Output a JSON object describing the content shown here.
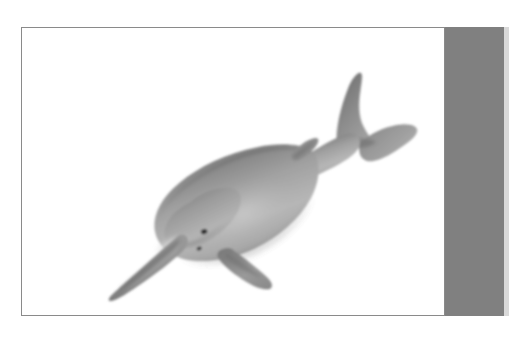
{
  "page": {
    "background_color": "#ffffff",
    "width": 514,
    "height": 339
  },
  "figure": {
    "alt_text": "Grayscale illustration of a river dolphin with a long narrow beak, swimming diagonally upward to the right",
    "border_color": "#8a8a8a",
    "card_background": "#ffffff",
    "body_color_light": "#b0b0b0",
    "body_color_mid": "#949494",
    "body_color_dark": "#6f6f6f",
    "belly_color": "#e2e2e2",
    "eye_color": "#2b2b2b",
    "parts": [
      {
        "name": "rostrum",
        "label": "Rostrum (beak)"
      },
      {
        "name": "melon",
        "label": "Melon"
      },
      {
        "name": "eye",
        "label": "Eye"
      },
      {
        "name": "blowhole",
        "label": "Blowhole"
      },
      {
        "name": "pectoral-fin",
        "label": "Pectoral flipper"
      },
      {
        "name": "dorsal-ridge",
        "label": "Dorsal ridge"
      },
      {
        "name": "peduncle",
        "label": "Tail stock"
      },
      {
        "name": "fluke-upper",
        "label": "Upper fluke lobe"
      },
      {
        "name": "fluke-lower",
        "label": "Lower fluke lobe"
      }
    ]
  },
  "overlay": {
    "band_color": "#808080",
    "band_edge_color": "#d9d9d9",
    "band_label": "gray-vertical-band"
  }
}
